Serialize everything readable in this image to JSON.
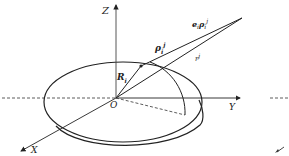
{
  "diagram": {
    "type": "3d-coordinate-geometry",
    "axes": {
      "x_label": "X",
      "y_label": "Y",
      "z_label": "Z",
      "origin_label": "O"
    },
    "vectors": {
      "R_label": "R",
      "R_sub": "i",
      "rho_label": "ρ",
      "rho_sub": "i",
      "rho_sup": "j",
      "unit_rho_prefix": "e",
      "unit_rho_prefix_sub": "i",
      "unit_rho_body": "ρ",
      "unit_rho_sub": "i",
      "unit_rho_sup": "j",
      "r_label": "r",
      "r_sup": "j"
    },
    "colors": {
      "stroke": "#222222",
      "background": "#ffffff"
    }
  }
}
